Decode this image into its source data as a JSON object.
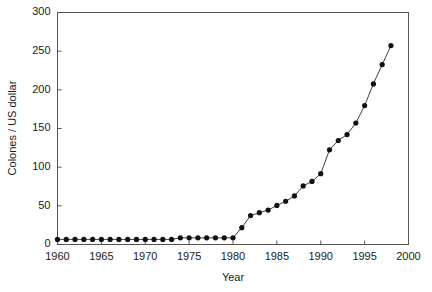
{
  "chart_data": {
    "type": "line",
    "title": "",
    "xlabel": "Year",
    "ylabel": "Colones / US dollar",
    "xlim": [
      1960,
      2000
    ],
    "ylim": [
      0,
      300
    ],
    "grid": false,
    "legend": false,
    "xticks": [
      1960,
      1965,
      1970,
      1975,
      1980,
      1985,
      1990,
      1995,
      2000
    ],
    "xtick_labels": [
      "1960",
      "1965",
      "1970",
      "1975",
      "1980",
      "1985",
      "1990",
      "1995",
      "2000"
    ],
    "yticks": [
      0,
      50,
      100,
      150,
      200,
      250,
      300
    ],
    "ytick_labels": [
      "0",
      "50",
      "100",
      "150",
      "200",
      "250",
      "300"
    ],
    "x": [
      1960,
      1961,
      1962,
      1963,
      1964,
      1965,
      1966,
      1967,
      1968,
      1969,
      1970,
      1971,
      1972,
      1973,
      1974,
      1975,
      1976,
      1977,
      1978,
      1979,
      1980,
      1981,
      1982,
      1983,
      1984,
      1985,
      1986,
      1987,
      1988,
      1989,
      1990,
      1991,
      1992,
      1993,
      1994,
      1995,
      1996,
      1997,
      1998
    ],
    "values": [
      6.6,
      6.6,
      6.6,
      6.6,
      6.6,
      6.6,
      6.6,
      6.6,
      6.6,
      6.6,
      6.6,
      6.6,
      6.6,
      6.6,
      8.6,
      8.6,
      8.6,
      8.6,
      8.6,
      8.6,
      8.6,
      21.8,
      37.4,
      41.1,
      44.5,
      50.5,
      55.9,
      62.8,
      75.8,
      81.5,
      91.6,
      122.4,
      134.5,
      142.2,
      157.1,
      179.7,
      207.7,
      232.6,
      257.2
    ],
    "series_name": "Colones / US dollar",
    "marker": "filled-circle",
    "line_color": "#404040",
    "marker_color": "#111111"
  },
  "axes": {
    "x_title": "Year",
    "y_title": "Colones / US dollar"
  }
}
